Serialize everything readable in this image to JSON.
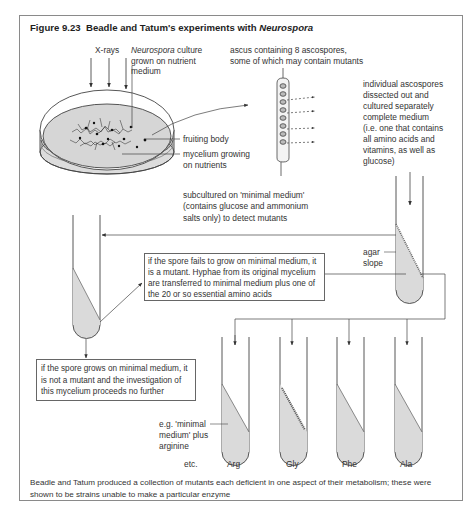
{
  "figure": {
    "number": "Figure 9.23",
    "title_prefix": "Beadle and Tatum's experiments with ",
    "title_italic": "Neurospora"
  },
  "labels": {
    "xrays": "X-rays",
    "culture_italic": "Neurospora",
    "culture_rest_1": " culture",
    "culture_line2": "grown on nutrient",
    "culture_line3": "medium",
    "ascus_line1": "ascus containing 8 ascospores,",
    "ascus_line2": "some of which may contain mutants",
    "fruiting_body": "fruiting body",
    "mycelium_line1": "mycelium growing",
    "mycelium_line2": "on nutrients",
    "individual": [
      "individual ascospores",
      "dissected out and",
      "cultured separately",
      "complete medium",
      "(i.e. one that contains",
      "all amino acids and",
      "vitamins, as well as",
      "glucose)"
    ],
    "subcultured": [
      "subcultured on 'minimal medium'",
      "(contains glucose and ammonium",
      "salts only) to detect mutants"
    ],
    "agar_line1": "agar",
    "agar_line2": "slope",
    "mutant_box": [
      "if the spore fails to grow on minimal medium, it",
      "is a mutant. Hyphae from its original mycelium",
      "are transferred to minimal medium plus one of",
      "the 20 or so essential amino acids"
    ],
    "non_mutant_box": [
      "if the spore grows on minimal medium, it",
      "is not a mutant and the investigation of",
      "this mycelium proceeds no further"
    ],
    "example": [
      "e.g. 'minimal",
      "medium' plus",
      "arginine"
    ],
    "etc": "etc."
  },
  "tubes": [
    {
      "label": "Arg",
      "growth": false
    },
    {
      "label": "Gly",
      "growth": true
    },
    {
      "label": "Phe",
      "growth": false
    },
    {
      "label": "Ala",
      "growth": false
    }
  ],
  "caption": "Beadle and Tatum produced a collection of mutants each deficient in one aspect of their metabolism; these were shown to be strains unable to make a particular enzyme",
  "colors": {
    "line": "#444444",
    "medium_fill": "#d9d9d9",
    "frame": "#8a8a8a"
  }
}
